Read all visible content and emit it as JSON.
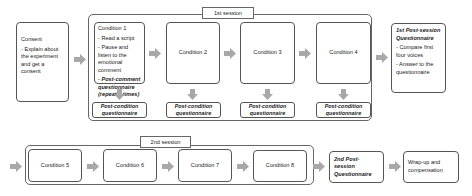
{
  "consent": {
    "title": "Consent",
    "bullets": [
      "- Explain about the experiment and get a consent"
    ]
  },
  "session1": {
    "label": "1st session",
    "conditions": [
      {
        "title": "Condition 1",
        "bullets": [
          "- Read a script",
          "- Pause and listen to the emotional comment"
        ],
        "emphasis": "- Post-comment questionnaire (repeat 8 times)"
      },
      {
        "title": "Condition 2"
      },
      {
        "title": "Condition 3"
      },
      {
        "title": "Condition 4"
      }
    ],
    "post_condition": "Post-condition questionnaire"
  },
  "post_session1": {
    "title": "1st Post-session Questionnaire",
    "bullets": [
      "- Compare first four voices",
      "- Answer to the questionnaire"
    ]
  },
  "session2": {
    "label": "2nd session",
    "conditions": [
      {
        "title": "Condition 5"
      },
      {
        "title": "Condition 6"
      },
      {
        "title": "Condition 7"
      },
      {
        "title": "Condition 8"
      }
    ]
  },
  "post_session2": {
    "title": "2nd Post-session Questionnaire"
  },
  "wrapup": {
    "title": "Wrap-up and compensation"
  },
  "colors": {
    "arrow": "#a8a8a8",
    "border": "#555555"
  }
}
